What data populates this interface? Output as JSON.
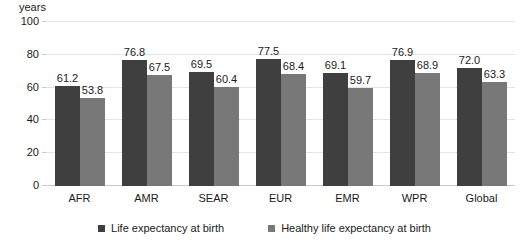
{
  "chart_data": {
    "type": "bar",
    "title": "",
    "subtitle": "",
    "xlabel": "",
    "ylabel": "years",
    "unit_caption": "years",
    "ylim": [
      0,
      100
    ],
    "yticks": [
      0,
      20,
      40,
      60,
      80,
      100
    ],
    "ytick_labels": [
      "0",
      "20",
      "40",
      "60",
      "80",
      "100"
    ],
    "grid": true,
    "grid_axis": "y",
    "legend_position": "bottom-center",
    "categories": [
      "AFR",
      "AMR",
      "SEAR",
      "EUR",
      "EMR",
      "WPR",
      "Global"
    ],
    "series": [
      {
        "name": "Life expectancy at birth",
        "color": "#3f3f3f",
        "values": [
          61.2,
          76.8,
          69.5,
          77.5,
          69.1,
          76.9,
          72.0
        ],
        "value_labels": [
          "61.2",
          "76.8",
          "69.5",
          "77.5",
          "69.1",
          "76.9",
          "72.0"
        ]
      },
      {
        "name": "Healthy life expectancy at birth",
        "color": "#787878",
        "values": [
          53.8,
          67.5,
          60.4,
          68.4,
          59.7,
          68.9,
          63.3
        ],
        "value_labels": [
          "53.8",
          "67.5",
          "60.4",
          "68.4",
          "59.7",
          "68.9",
          "63.3"
        ]
      }
    ]
  },
  "legend": {
    "items": [
      {
        "label": "Life expectancy at birth",
        "color": "#3f3f3f"
      },
      {
        "label": "Healthy life expectancy at birth",
        "color": "#787878"
      }
    ]
  },
  "colors": {
    "series_dark": "#3f3f3f",
    "series_light": "#787878",
    "gridline": "#e2e4e8",
    "axis": "#c8cbd0",
    "text": "#1a1a1a",
    "background": "#ffffff"
  }
}
